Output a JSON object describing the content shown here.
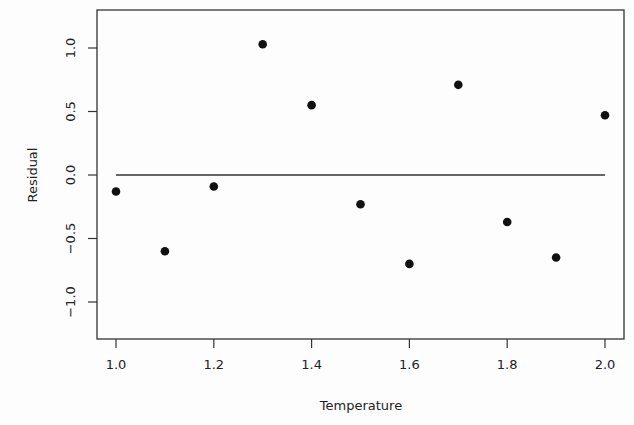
{
  "chart_data": {
    "type": "scatter",
    "title": "",
    "xlabel": "Temperature",
    "ylabel": "Residual",
    "xlim": [
      0.96,
      2.04
    ],
    "ylim": [
      -1.29,
      1.29
    ],
    "grid": false,
    "legend": null,
    "x_ticks": [
      1.0,
      1.2,
      1.4,
      1.6,
      1.8,
      2.0
    ],
    "x_tick_labels": [
      "1.0",
      "1.2",
      "1.4",
      "1.6",
      "1.8",
      "2.0"
    ],
    "y_ticks": [
      -1.0,
      -0.5,
      0.0,
      0.5,
      1.0
    ],
    "y_tick_labels": [
      "−1.0",
      "−0.5",
      "0.0",
      "0.5",
      "1.0"
    ],
    "reference_line": {
      "y": 0.0,
      "x_from": 1.0,
      "x_to": 2.0
    },
    "x": [
      1.0,
      1.1,
      1.2,
      1.3,
      1.4,
      1.5,
      1.6,
      1.7,
      1.8,
      1.9,
      2.0
    ],
    "y": [
      -0.13,
      -0.6,
      -0.09,
      1.03,
      0.55,
      -0.23,
      -0.7,
      0.71,
      -0.37,
      -0.65,
      0.47
    ],
    "marker": "filled-circle",
    "colors": {
      "points": "#111111",
      "axes": "#333333",
      "line": "#333333"
    }
  },
  "layout": {
    "plot_left": 97,
    "plot_right": 624,
    "plot_top": 10,
    "plot_bottom": 339,
    "x_px_per_unit": 489,
    "x_origin_px": 116,
    "y_px_per_unit": 127,
    "y_origin_px": 175
  }
}
